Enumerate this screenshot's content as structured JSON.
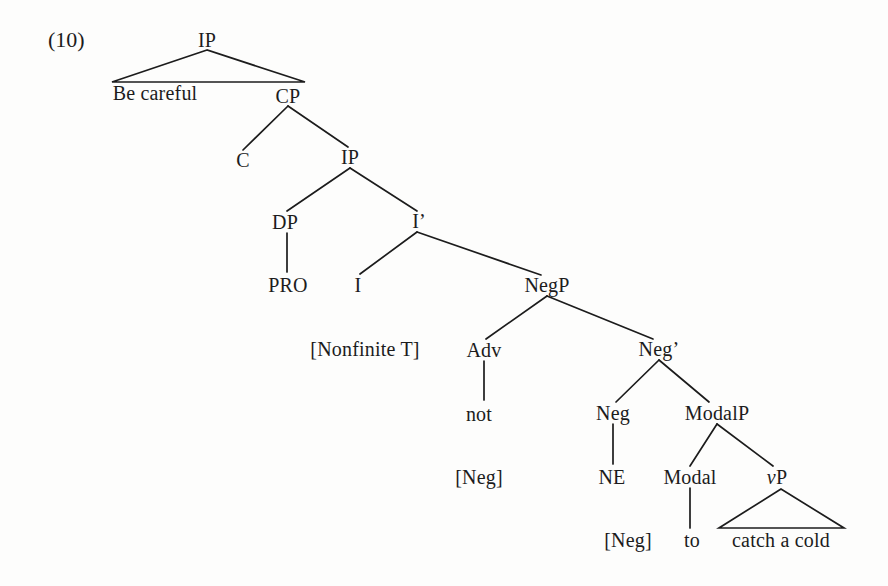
{
  "example": {
    "number": "(10)"
  },
  "tree": {
    "type": "syntax-tree",
    "sentence": "Be careful not to catch a cold",
    "nodes": [
      {
        "id": "ip-root",
        "label": "IP",
        "x": 207,
        "y": 40,
        "kind": "phrase"
      },
      {
        "id": "be-careful",
        "label": "Be careful",
        "x": 155,
        "y": 93,
        "kind": "terminal"
      },
      {
        "id": "cp",
        "label": "CP",
        "x": 288,
        "y": 96,
        "kind": "phrase"
      },
      {
        "id": "c",
        "label": "C",
        "x": 243,
        "y": 160,
        "kind": "head"
      },
      {
        "id": "ip-embedded",
        "label": "IP",
        "x": 350,
        "y": 157,
        "kind": "phrase"
      },
      {
        "id": "dp",
        "label": "DP",
        "x": 285,
        "y": 222,
        "kind": "phrase"
      },
      {
        "id": "i-bar",
        "label": "I’",
        "x": 419,
        "y": 221,
        "kind": "bar"
      },
      {
        "id": "pro",
        "label": "PRO",
        "x": 288,
        "y": 285,
        "kind": "terminal"
      },
      {
        "id": "i",
        "label": "I",
        "x": 358,
        "y": 285,
        "kind": "head"
      },
      {
        "id": "negp",
        "label": "NegP",
        "x": 547,
        "y": 285,
        "kind": "phrase"
      },
      {
        "id": "nonfinite-t",
        "label": "[Nonfinite T]",
        "x": 365,
        "y": 349,
        "kind": "feature"
      },
      {
        "id": "adv",
        "label": "Adv",
        "x": 484,
        "y": 350,
        "kind": "head"
      },
      {
        "id": "neg-bar",
        "label": "Neg’",
        "x": 659,
        "y": 349,
        "kind": "bar"
      },
      {
        "id": "not",
        "label": "not",
        "x": 479,
        "y": 414,
        "kind": "terminal"
      },
      {
        "id": "neg",
        "label": "Neg",
        "x": 613,
        "y": 413,
        "kind": "head"
      },
      {
        "id": "modalp",
        "label": "ModalP",
        "x": 717,
        "y": 413,
        "kind": "phrase"
      },
      {
        "id": "neg-feature-adv",
        "label": "[Neg]",
        "x": 479,
        "y": 477,
        "kind": "feature"
      },
      {
        "id": "ne",
        "label": "NE",
        "x": 612,
        "y": 477,
        "kind": "terminal"
      },
      {
        "id": "modal",
        "label": "Modal",
        "x": 690,
        "y": 477,
        "kind": "head"
      },
      {
        "id": "vp",
        "label": "vP",
        "x": 777,
        "y": 477,
        "kind": "phrase",
        "italic_first": true
      },
      {
        "id": "neg-feature-ne",
        "label": "[Neg]",
        "x": 628,
        "y": 540,
        "kind": "feature"
      },
      {
        "id": "to",
        "label": "to",
        "x": 692,
        "y": 540,
        "kind": "terminal"
      },
      {
        "id": "catch-a-cold",
        "label": "catch a cold",
        "x": 781,
        "y": 540,
        "kind": "terminal"
      }
    ],
    "triangles": [
      {
        "id": "triangle-ip-root",
        "apex_x": 207,
        "apex_y": 50,
        "left_x": 112,
        "right_x": 305,
        "base_y": 82
      },
      {
        "id": "triangle-vp",
        "apex_x": 781,
        "apex_y": 489,
        "left_x": 719,
        "right_x": 844,
        "base_y": 528
      }
    ],
    "branches": [
      {
        "id": "cp-to-c",
        "x1": 288,
        "y1": 106,
        "x2": 243,
        "y2": 150
      },
      {
        "id": "cp-to-ip",
        "x1": 288,
        "y1": 106,
        "x2": 348,
        "y2": 147
      },
      {
        "id": "ip-to-dp",
        "x1": 350,
        "y1": 168,
        "x2": 287,
        "y2": 211
      },
      {
        "id": "ip-to-ibar",
        "x1": 350,
        "y1": 168,
        "x2": 417,
        "y2": 211
      },
      {
        "id": "dp-to-pro",
        "x1": 287,
        "y1": 233,
        "x2": 287,
        "y2": 272
      },
      {
        "id": "ibar-to-i",
        "x1": 417,
        "y1": 232,
        "x2": 360,
        "y2": 274
      },
      {
        "id": "ibar-to-negp",
        "x1": 417,
        "y1": 232,
        "x2": 541,
        "y2": 275
      },
      {
        "id": "negp-to-adv",
        "x1": 547,
        "y1": 296,
        "x2": 486,
        "y2": 339
      },
      {
        "id": "negp-to-negbar",
        "x1": 547,
        "y1": 296,
        "x2": 653,
        "y2": 339
      },
      {
        "id": "adv-to-not",
        "x1": 484,
        "y1": 361,
        "x2": 484,
        "y2": 400
      },
      {
        "id": "negbar-to-neg",
        "x1": 659,
        "y1": 360,
        "x2": 616,
        "y2": 402
      },
      {
        "id": "negbar-to-modalp",
        "x1": 659,
        "y1": 360,
        "x2": 709,
        "y2": 402
      },
      {
        "id": "neg-to-ne",
        "x1": 613,
        "y1": 424,
        "x2": 613,
        "y2": 464
      },
      {
        "id": "modalp-to-modal",
        "x1": 717,
        "y1": 424,
        "x2": 690,
        "y2": 466
      },
      {
        "id": "modalp-to-vp",
        "x1": 717,
        "y1": 424,
        "x2": 773,
        "y2": 466
      },
      {
        "id": "modal-to-to",
        "x1": 690,
        "y1": 488,
        "x2": 690,
        "y2": 528
      }
    ]
  },
  "style": {
    "line_color": "#1c1c1c",
    "text_color": "#1c1c1c",
    "background": "#fdfdfc"
  }
}
